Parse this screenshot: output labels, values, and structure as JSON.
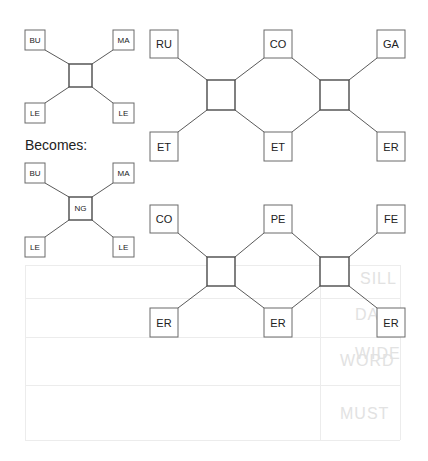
{
  "caption": "Becomes:",
  "small_before": {
    "nodes": [
      "BU",
      "MA",
      "LE",
      "LE"
    ],
    "hub": ""
  },
  "small_after": {
    "nodes": [
      "BU",
      "MA",
      "LE",
      "LE"
    ],
    "hub": "NG"
  },
  "chain_top": {
    "top": [
      "RU",
      "CO",
      "GA"
    ],
    "bottom": [
      "ET",
      "ET",
      "ER"
    ]
  },
  "chain_bottom": {
    "top": [
      "CO",
      "PE",
      "FE"
    ],
    "bottom": [
      "ER",
      "ER",
      "ER"
    ]
  },
  "ghost_words": [
    "SILL",
    "DAYS",
    "WIDE",
    "WORD",
    "MUST"
  ]
}
